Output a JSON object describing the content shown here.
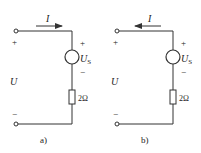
{
  "circuits": [
    {
      "id": "a",
      "caption": "a)",
      "current_label": "I",
      "current_direction": "right",
      "source_label": "U",
      "source_sub": "S",
      "source_plus": "+",
      "source_minus": "−",
      "resistor_label": "2Ω",
      "voltage_label": "U",
      "terminal_plus": "+",
      "terminal_minus": "−"
    },
    {
      "id": "b",
      "caption": "b)",
      "current_label": "I",
      "current_direction": "left",
      "source_label": "U",
      "source_sub": "S",
      "source_plus": "+",
      "source_minus": "−",
      "resistor_label": "2Ω",
      "voltage_label": "U",
      "terminal_plus": "+",
      "terminal_minus": "−"
    }
  ],
  "colors": {
    "line": "#333333",
    "text": "#222222",
    "background": "#ffffff"
  }
}
